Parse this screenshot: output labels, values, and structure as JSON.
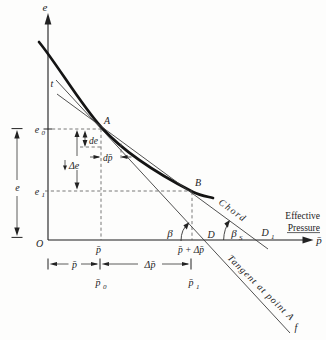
{
  "fig": {
    "y_axis_label": "e",
    "x_axis_label": "p̄",
    "x_axis_title": {
      "line1": "Effective",
      "line2": "Pressure"
    },
    "origin_label": "O",
    "points": {
      "A": "A",
      "B": "B"
    },
    "tangent": {
      "top_label": "t",
      "bottom_label": "f",
      "name": "Tangent at point A",
      "axis_point": "D"
    },
    "chord": {
      "name": "Chord",
      "axis_point_base": "D",
      "axis_point_sub": "1"
    },
    "void_ratio": {
      "initial_base": "e",
      "initial_sub": "0",
      "final_base": "e",
      "final_sub": "1",
      "span": "e",
      "delta": "Δe",
      "differential": "de"
    },
    "pressure": {
      "at_A": "p̄",
      "at_B": "p̄ + Δp̄",
      "differential": "dp̄",
      "span_p": "p̄",
      "span_delta": "Δp̄",
      "p0_base": "p̄",
      "p0_sub": "0",
      "p1_base": "p̄",
      "p1_sub": "1"
    },
    "angles": {
      "tangent_angle": "β",
      "chord_angle_base": "β",
      "chord_angle_sub": "S"
    }
  }
}
